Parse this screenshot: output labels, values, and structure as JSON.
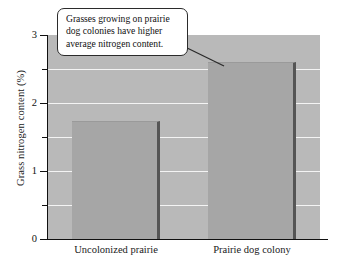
{
  "chart_data": {
    "type": "bar",
    "title": "",
    "xlabel": "",
    "ylabel": "Grass nitrogen content  (%)",
    "categories": [
      "Uncolonized prairie",
      "Prairie dog colony"
    ],
    "values": [
      1.74,
      2.6
    ],
    "ylim": [
      0,
      3
    ],
    "ytick_labels": [
      "0",
      "1",
      "2",
      "3"
    ],
    "ytick_values": [
      0,
      1,
      2,
      3
    ],
    "minor_tick_values": [
      0.5,
      1.5,
      2.5
    ],
    "gridlines": [
      0.5,
      1.0,
      1.5,
      2.0,
      2.5
    ],
    "grid": true,
    "legend": "none",
    "annotation": "Grasses growing on prairie dog colonies have higher average nitrogen content.",
    "annotation_target_category": "Prairie dog colony",
    "colors": {
      "plot_background": "#b9b9b9",
      "bar_fill": "#a6a6a6",
      "bar_edge": "#555555",
      "gridline": "#f4f4f4",
      "axis": "#111111",
      "callout_background": "#ffffff",
      "callout_border": "#2b2b2b",
      "text": "#1a1a1a"
    }
  }
}
